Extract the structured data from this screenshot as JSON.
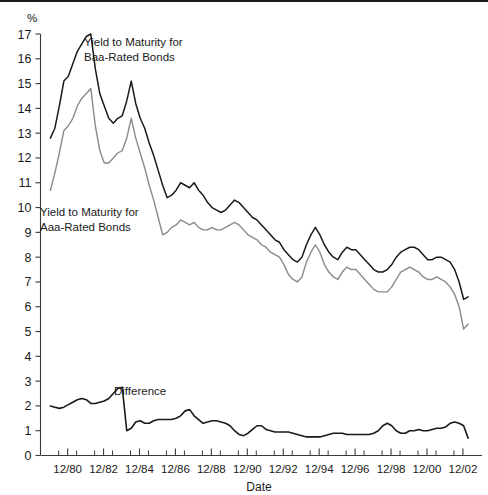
{
  "figure": {
    "unit_label": "%",
    "xlabel": "Date",
    "background": "#ffffff",
    "top_rule_color": "#1a1a1a"
  },
  "annotations": {
    "baa_line1": "Yield to Maturity for",
    "baa_line2": "Baa-Rated Bonds",
    "aaa_line1": "Yield to Maturity for",
    "aaa_line2": "Aaa-Rated Bonds",
    "difference": "Difference"
  },
  "colors": {
    "baa": "#1a1a1a",
    "aaa": "#8a8a8a",
    "difference": "#1a1a1a",
    "axis": "#3a3a3a"
  },
  "chart_data": {
    "type": "line",
    "title": "",
    "subtitle": "",
    "xlabel": "Date",
    "ylabel": "%",
    "ylim": [
      0,
      17
    ],
    "xlim": [
      "6/80",
      "6/03"
    ],
    "grid": false,
    "legend_position": "inline-annotations",
    "ytick_labels": [
      "0",
      "1",
      "2",
      "3",
      "4",
      "5",
      "6",
      "7",
      "8",
      "9",
      "10",
      "11",
      "12",
      "13",
      "14",
      "15",
      "16",
      "17"
    ],
    "ytick_values": [
      0,
      1,
      2,
      3,
      4,
      5,
      6,
      7,
      8,
      9,
      10,
      11,
      12,
      13,
      14,
      15,
      16,
      17
    ],
    "xtick_labels": [
      "12/80",
      "12/82",
      "12/84",
      "12/86",
      "12/88",
      "12/90",
      "12/92",
      "12/94",
      "12/96",
      "12/98",
      "12/00",
      "12/02"
    ],
    "xtick_values": [
      1980.96,
      1982.96,
      1984.96,
      1986.96,
      1988.96,
      1990.96,
      1992.96,
      1994.96,
      1996.96,
      1998.96,
      2000.96,
      2002.96
    ],
    "minor_xtick_values": [
      1980.46,
      1981.46,
      1982.46,
      1983.46,
      1984.46,
      1985.46,
      1986.46,
      1987.46,
      1988.46,
      1989.46,
      1990.46,
      1991.46,
      1992.46,
      1993.46,
      1994.46,
      1995.46,
      1996.46,
      1997.46,
      1998.46,
      1999.46,
      2000.46,
      2001.46,
      2002.46
    ],
    "x": [
      1980.0,
      1980.25,
      1980.5,
      1980.75,
      1981.0,
      1981.25,
      1981.5,
      1981.75,
      1982.0,
      1982.25,
      1982.5,
      1982.75,
      1983.0,
      1983.25,
      1983.5,
      1983.75,
      1984.0,
      1984.25,
      1984.5,
      1984.75,
      1985.0,
      1985.25,
      1985.5,
      1985.75,
      1986.0,
      1986.25,
      1986.5,
      1986.75,
      1987.0,
      1987.25,
      1987.5,
      1987.75,
      1988.0,
      1988.25,
      1988.5,
      1988.75,
      1989.0,
      1989.25,
      1989.5,
      1989.75,
      1990.0,
      1990.25,
      1990.5,
      1990.75,
      1991.0,
      1991.25,
      1991.5,
      1991.75,
      1992.0,
      1992.25,
      1992.5,
      1992.75,
      1993.0,
      1993.25,
      1993.5,
      1993.75,
      1994.0,
      1994.25,
      1994.5,
      1994.75,
      1995.0,
      1995.25,
      1995.5,
      1995.75,
      1996.0,
      1996.25,
      1996.5,
      1996.75,
      1997.0,
      1997.25,
      1997.5,
      1997.75,
      1998.0,
      1998.25,
      1998.5,
      1998.75,
      1999.0,
      1999.25,
      1999.5,
      1999.75,
      2000.0,
      2000.25,
      2000.5,
      2000.75,
      2001.0,
      2001.25,
      2001.5,
      2001.75,
      2002.0,
      2002.25,
      2002.5,
      2002.75,
      2003.0,
      2003.25
    ],
    "series": [
      {
        "name": "Yield to Maturity for Baa-Rated Bonds",
        "color": "#1a1a1a",
        "values": [
          12.8,
          13.2,
          14.1,
          15.1,
          15.3,
          15.8,
          16.3,
          16.6,
          16.9,
          17.0,
          15.6,
          14.6,
          14.1,
          13.6,
          13.4,
          13.6,
          13.7,
          14.3,
          15.1,
          14.2,
          13.6,
          13.2,
          12.6,
          12.1,
          11.5,
          10.9,
          10.4,
          10.5,
          10.7,
          11.0,
          10.9,
          10.8,
          11.0,
          10.7,
          10.5,
          10.2,
          10.0,
          9.9,
          9.8,
          9.9,
          10.1,
          10.3,
          10.2,
          10.0,
          9.8,
          9.6,
          9.5,
          9.3,
          9.1,
          8.9,
          8.7,
          8.6,
          8.3,
          8.1,
          7.9,
          7.8,
          8.0,
          8.5,
          8.9,
          9.2,
          8.9,
          8.5,
          8.2,
          8.0,
          7.9,
          8.2,
          8.4,
          8.3,
          8.3,
          8.1,
          7.9,
          7.7,
          7.5,
          7.4,
          7.4,
          7.5,
          7.7,
          8.0,
          8.2,
          8.3,
          8.4,
          8.4,
          8.3,
          8.1,
          7.9,
          7.9,
          8.0,
          8.0,
          7.9,
          7.8,
          7.5,
          7.0,
          6.3,
          6.4
        ]
      },
      {
        "name": "Yield to Maturity for Aaa-Rated Bonds",
        "color": "#8a8a8a",
        "values": [
          10.7,
          11.4,
          12.2,
          13.1,
          13.3,
          13.6,
          14.1,
          14.4,
          14.6,
          14.8,
          13.3,
          12.3,
          11.8,
          11.8,
          12.0,
          12.2,
          12.3,
          12.8,
          13.6,
          12.8,
          12.2,
          11.6,
          10.9,
          10.3,
          9.6,
          8.9,
          9.0,
          9.2,
          9.3,
          9.5,
          9.4,
          9.3,
          9.4,
          9.2,
          9.1,
          9.1,
          9.2,
          9.1,
          9.1,
          9.2,
          9.3,
          9.4,
          9.3,
          9.1,
          8.9,
          8.8,
          8.7,
          8.5,
          8.4,
          8.2,
          8.1,
          8.0,
          7.7,
          7.3,
          7.1,
          7.0,
          7.2,
          7.8,
          8.2,
          8.5,
          8.2,
          7.7,
          7.4,
          7.2,
          7.1,
          7.4,
          7.6,
          7.5,
          7.5,
          7.3,
          7.1,
          6.9,
          6.7,
          6.6,
          6.6,
          6.6,
          6.8,
          7.1,
          7.4,
          7.5,
          7.6,
          7.5,
          7.4,
          7.2,
          7.1,
          7.1,
          7.2,
          7.1,
          7.0,
          6.8,
          6.5,
          6.0,
          5.1,
          5.3
        ]
      }
    ],
    "difference_series": {
      "name": "Difference",
      "color": "#1a1a1a",
      "values": [
        2.0,
        1.95,
        1.9,
        1.95,
        2.05,
        2.15,
        2.25,
        2.3,
        2.25,
        2.1,
        2.1,
        2.15,
        2.2,
        2.3,
        2.5,
        2.7,
        2.75,
        1.0,
        1.1,
        1.35,
        1.4,
        1.3,
        1.3,
        1.4,
        1.45,
        1.45,
        1.45,
        1.45,
        1.5,
        1.6,
        1.8,
        1.85,
        1.6,
        1.45,
        1.3,
        1.35,
        1.4,
        1.4,
        1.35,
        1.3,
        1.2,
        1.0,
        0.85,
        0.8,
        0.9,
        1.05,
        1.2,
        1.2,
        1.05,
        1.0,
        0.95,
        0.95,
        0.95,
        0.95,
        0.9,
        0.85,
        0.8,
        0.75,
        0.75,
        0.75,
        0.75,
        0.8,
        0.85,
        0.9,
        0.9,
        0.9,
        0.85,
        0.85,
        0.85,
        0.85,
        0.85,
        0.85,
        0.9,
        1.0,
        1.2,
        1.3,
        1.2,
        1.0,
        0.9,
        0.9,
        1.0,
        1.0,
        1.05,
        1.0,
        1.0,
        1.05,
        1.1,
        1.1,
        1.15,
        1.3,
        1.35,
        1.3,
        1.2,
        0.7
      ]
    }
  }
}
